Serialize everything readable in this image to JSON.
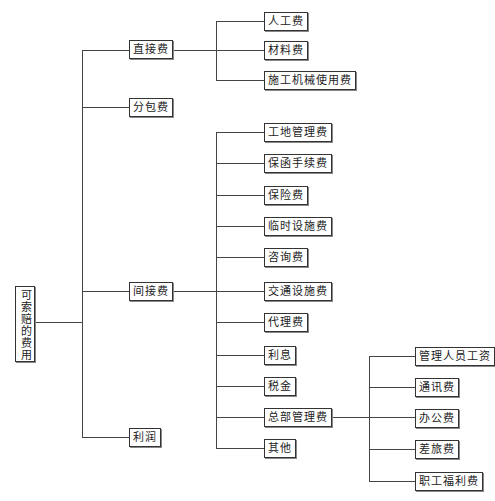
{
  "diagram": {
    "root": {
      "label": "可索赔的费用"
    },
    "level1": [
      {
        "label": "直接费",
        "children": [
          "人工费",
          "材料费",
          "施工机械使用费"
        ]
      },
      {
        "label": "分包费"
      },
      {
        "label": "间接费",
        "children": [
          "工地管理费",
          "保函手续费",
          "保险费",
          "临时设施费",
          "咨询费",
          "交通设施费",
          "代理费",
          "利息",
          "税金",
          "总部管理费",
          "其他"
        ]
      },
      {
        "label": "利润"
      }
    ],
    "headquarters_children": [
      "管理人员工资",
      "通讯费",
      "办公费",
      "差旅费",
      "职工福利费"
    ]
  },
  "nodes": {
    "root": "可索赔的费用",
    "direct": "直接费",
    "subcontract": "分包费",
    "indirect": "间接费",
    "profit": "利润",
    "labor": "人工费",
    "material": "材料费",
    "machinery": "施工机械使用费",
    "site_mgmt": "工地管理费",
    "guarantee": "保函手续费",
    "insurance": "保险费",
    "temp_facilities": "临时设施费",
    "consulting": "咨询费",
    "transport": "交通设施费",
    "agency": "代理费",
    "interest": "利息",
    "tax": "税金",
    "hq_mgmt": "总部管理费",
    "other": "其他",
    "mgmt_salary": "管理人员工资",
    "communication": "通讯费",
    "office": "办公费",
    "travel": "差旅费",
    "welfare": "职工福利费"
  }
}
